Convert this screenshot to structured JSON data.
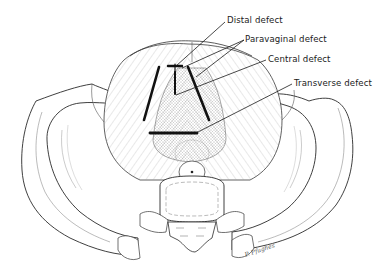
{
  "figure": {
    "labels": [
      {
        "id": "distal",
        "text": "Distal defect"
      },
      {
        "id": "paravaginal",
        "text": "Paravaginal defect"
      },
      {
        "id": "central",
        "text": "Central defect"
      },
      {
        "id": "transverse",
        "text": "Transverse defect"
      }
    ],
    "signature": "P. Pfughes",
    "colors": {
      "line": "#1a1a1a",
      "sketch": "#6a6a6a",
      "background": "#ffffff"
    }
  }
}
